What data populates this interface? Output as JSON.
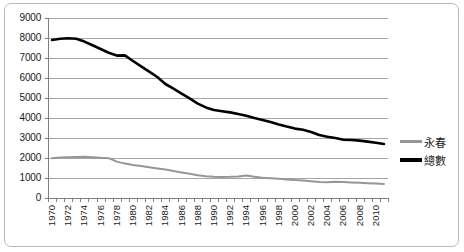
{
  "chart_data": {
    "type": "line",
    "title": "",
    "xlabel": "",
    "ylabel": "",
    "ylim": [
      0,
      9000
    ],
    "ytick_step": 1000,
    "yticks": [
      "9000",
      "8000",
      "7000",
      "6000",
      "5000",
      "4000",
      "3000",
      "2000",
      "1000",
      "0"
    ],
    "grid": true,
    "legend_position": "right",
    "x": [
      1970,
      1971,
      1972,
      1973,
      1974,
      1975,
      1976,
      1977,
      1978,
      1979,
      1980,
      1981,
      1982,
      1983,
      1984,
      1985,
      1986,
      1987,
      1988,
      1989,
      1990,
      1991,
      1992,
      1993,
      1994,
      1995,
      1996,
      1997,
      1998,
      1999,
      2000,
      2001,
      2002,
      2003,
      2004,
      2005,
      2006,
      2007,
      2008,
      2009,
      2010,
      2011
    ],
    "xticks": [
      "1970",
      "1972",
      "1974",
      "1976",
      "1978",
      "1980",
      "1982",
      "1984",
      "1986",
      "1988",
      "1990",
      "1992",
      "1994",
      "1996",
      "1998",
      "2000",
      "2002",
      "2004",
      "2006",
      "2008",
      "2010"
    ],
    "xlim": [
      1970,
      2011
    ],
    "series": [
      {
        "name": "永春",
        "color": "#969696",
        "values": [
          1990,
          2020,
          2040,
          2050,
          2060,
          2040,
          2010,
          1990,
          1820,
          1720,
          1650,
          1600,
          1540,
          1480,
          1420,
          1350,
          1280,
          1210,
          1140,
          1090,
          1060,
          1050,
          1060,
          1080,
          1130,
          1060,
          1010,
          990,
          960,
          930,
          900,
          880,
          840,
          800,
          790,
          810,
          800,
          780,
          760,
          740,
          720,
          700
        ]
      },
      {
        "name": "總數",
        "color": "#000000",
        "values": [
          7900,
          7960,
          7990,
          7960,
          7820,
          7640,
          7450,
          7260,
          7120,
          7130,
          6850,
          6580,
          6320,
          6050,
          5700,
          5470,
          5220,
          4980,
          4720,
          4530,
          4400,
          4340,
          4280,
          4200,
          4110,
          4000,
          3900,
          3800,
          3680,
          3570,
          3470,
          3410,
          3300,
          3150,
          3060,
          3000,
          2910,
          2900,
          2870,
          2820,
          2760,
          2700
        ]
      }
    ]
  },
  "legend": {
    "items": [
      {
        "label": "永春",
        "color": "#969696"
      },
      {
        "label": "總數",
        "color": "#000000"
      }
    ]
  }
}
